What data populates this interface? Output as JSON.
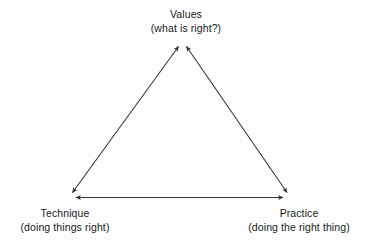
{
  "diagram": {
    "type": "triangle-relationship-diagram",
    "background_color": "#fdfdfd",
    "line_color": "#333333",
    "text_color": "#1a1a1a",
    "nodes": [
      {
        "id": "values",
        "position": "top",
        "title": "Values",
        "subtitle": "(what is right?)"
      },
      {
        "id": "technique",
        "position": "bottom-left",
        "title": "Technique",
        "subtitle": "(doing things right)"
      },
      {
        "id": "practice",
        "position": "bottom-right",
        "title": "Practice",
        "subtitle": "(doing the right thing)"
      }
    ],
    "connectors": [
      {
        "id": "technique-values",
        "from": "technique",
        "to": "values",
        "style": "double-headed-arrow"
      },
      {
        "id": "practice-values",
        "from": "practice",
        "to": "values",
        "style": "double-headed-arrow"
      },
      {
        "id": "technique-practice",
        "from": "technique",
        "to": "practice",
        "style": "double-headed-arrow"
      }
    ]
  }
}
